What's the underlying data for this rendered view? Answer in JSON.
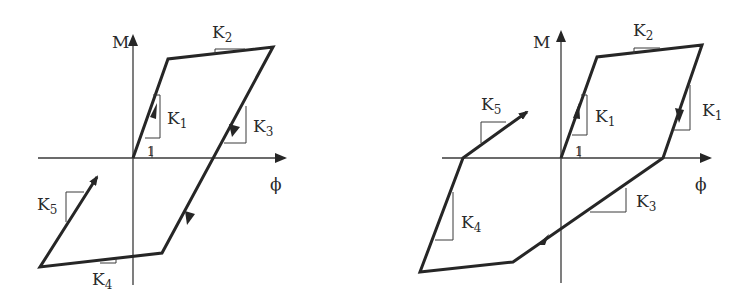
{
  "figure": {
    "colors": {
      "line": "#262626",
      "axis": "#3a3a3a",
      "background": "#ffffff"
    }
  },
  "left_diagram": {
    "y_axis_label": "M",
    "x_axis_label": "ϕ",
    "unit_slope_label": "1",
    "stiffness_labels": {
      "k1": {
        "base": "K",
        "sub": "1"
      },
      "k2": {
        "base": "K",
        "sub": "2"
      },
      "k3": {
        "base": "K",
        "sub": "3"
      },
      "k4": {
        "base": "K",
        "sub": "4"
      },
      "k5": {
        "base": "K",
        "sub": "5"
      }
    },
    "path_points": [
      [
        133,
        158
      ],
      [
        168,
        59
      ],
      [
        273,
        47
      ],
      [
        162,
        253
      ],
      [
        40,
        267
      ],
      [
        97,
        177
      ]
    ]
  },
  "right_diagram": {
    "y_axis_label": "M",
    "x_axis_label": "ϕ",
    "unit_slope_label": "1",
    "stiffness_labels": {
      "k1a": {
        "base": "K",
        "sub": "1"
      },
      "k1b": {
        "base": "K",
        "sub": "1"
      },
      "k2": {
        "base": "K",
        "sub": "2"
      },
      "k3": {
        "base": "K",
        "sub": "3"
      },
      "k4": {
        "base": "K",
        "sub": "4"
      },
      "k5": {
        "base": "K",
        "sub": "5"
      }
    },
    "path_points": [
      [
        561,
        158
      ],
      [
        597,
        57
      ],
      [
        702,
        45
      ],
      [
        663,
        158
      ],
      [
        513,
        262
      ],
      [
        420,
        272
      ],
      [
        463,
        158
      ],
      [
        527,
        112
      ]
    ]
  }
}
